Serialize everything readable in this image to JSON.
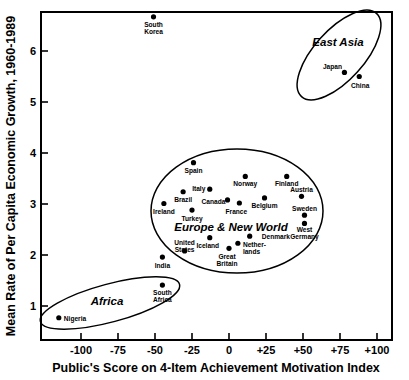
{
  "chart_data": {
    "type": "scatter",
    "title": "",
    "xlabel": "Public's Score on 4-Item Achievement Motivation Index",
    "ylabel": "Mean Rate of Per Capita Economic Growth, 1960-1989",
    "xlim": [
      -118,
      -118
    ],
    "ylim": [
      0.55,
      6.75
    ],
    "grid": false,
    "legend": "none",
    "xticks": [
      "-100",
      "-75",
      "-50",
      "-25",
      "0",
      "+25",
      "+50",
      "+75",
      "+100"
    ],
    "xtick_values": [
      -100,
      -75,
      -50,
      -25,
      0,
      25,
      50,
      75,
      100
    ],
    "yticks": [
      "1",
      "2",
      "3",
      "4",
      "5",
      "6"
    ],
    "ytick_values": [
      1,
      2,
      3,
      4,
      5,
      6
    ],
    "points": [
      {
        "label": "South Korea",
        "x": -51,
        "y": 6.67,
        "lx": 0,
        "ly": 10,
        "anchor": "middle"
      },
      {
        "label": "Japan",
        "x": 78,
        "y": 5.58,
        "lx": -12,
        "ly": -3,
        "anchor": "middle"
      },
      {
        "label": "China",
        "x": 88,
        "y": 5.5,
        "lx": 1,
        "ly": 11,
        "anchor": "middle"
      },
      {
        "label": "Spain",
        "x": -24,
        "y": 3.81,
        "lx": 0,
        "ly": 10,
        "anchor": "middle"
      },
      {
        "label": "Norway",
        "x": 11,
        "y": 3.54,
        "lx": 0,
        "ly": 10,
        "anchor": "middle"
      },
      {
        "label": "Finland",
        "x": 39,
        "y": 3.54,
        "lx": 0,
        "ly": 10,
        "anchor": "middle"
      },
      {
        "label": "Italy",
        "x": -13,
        "y": 3.29,
        "lx": -11,
        "ly": 2,
        "anchor": "middle"
      },
      {
        "label": "Brazil",
        "x": -31,
        "y": 3.24,
        "lx": 0,
        "ly": 10,
        "anchor": "middle"
      },
      {
        "label": "Austria",
        "x": 49,
        "y": 3.15,
        "lx": 0,
        "ly": -4,
        "anchor": "middle"
      },
      {
        "label": "Belgium",
        "x": 24,
        "y": 3.12,
        "lx": 0,
        "ly": 10,
        "anchor": "middle"
      },
      {
        "label": "Canada",
        "x": -1,
        "y": 3.08,
        "lx": -14,
        "ly": 4,
        "anchor": "middle"
      },
      {
        "label": "France",
        "x": 7,
        "y": 3.02,
        "lx": -3,
        "ly": 11,
        "anchor": "middle"
      },
      {
        "label": "Ireland",
        "x": -44,
        "y": 3.01,
        "lx": 0,
        "ly": 11,
        "anchor": "middle"
      },
      {
        "label": "Turkey",
        "x": -25,
        "y": 2.88,
        "lx": 0,
        "ly": 11,
        "anchor": "middle"
      },
      {
        "label": "Sweden",
        "x": 51,
        "y": 2.78,
        "lx": 0,
        "ly": -4,
        "anchor": "middle"
      },
      {
        "label": "West Germany",
        "x": 51,
        "y": 2.62,
        "lx": 0,
        "ly": 9,
        "anchor": "middle"
      },
      {
        "label": "Iceland",
        "x": -13,
        "y": 2.34,
        "lx": -2,
        "ly": 10,
        "anchor": "middle"
      },
      {
        "label": "Denmark",
        "x": 14,
        "y": 2.37,
        "lx": 12,
        "ly": 3,
        "anchor": "start"
      },
      {
        "label": "Netherlands",
        "x": 6,
        "y": 2.23,
        "lx": 5,
        "ly": 4,
        "anchor": "start"
      },
      {
        "label": "United States",
        "x": -30,
        "y": 2.08,
        "lx": 0,
        "ly": -6,
        "anchor": "middle"
      },
      {
        "label": "Great Britain",
        "x": 0,
        "y": 2.13,
        "lx": -2,
        "ly": 11,
        "anchor": "middle"
      },
      {
        "label": "India",
        "x": -45,
        "y": 1.96,
        "lx": 0,
        "ly": 11,
        "anchor": "middle"
      },
      {
        "label": "South Africa",
        "x": -45,
        "y": 1.41,
        "lx": 0,
        "ly": 10,
        "anchor": "middle"
      },
      {
        "label": "Nigeria",
        "x": -115,
        "y": 0.77,
        "lx": 5,
        "ly": 3,
        "anchor": "start"
      }
    ],
    "clusters": [
      {
        "name": "East Asia",
        "cx": 339,
        "cy": 55,
        "rx": 56,
        "ry": 25,
        "rot": -48,
        "lx": 338,
        "ly": 46,
        "fs": 11.5
      },
      {
        "name": "Europe & New World",
        "cx": 237,
        "cy": 211,
        "rx": 86,
        "ry": 62,
        "rot": 0,
        "lx": 231,
        "ly": 231,
        "fs": 11.5
      },
      {
        "name": "Africa",
        "cx": 110,
        "cy": 303,
        "rx": 72,
        "ry": 19,
        "rot": -15,
        "lx": 107,
        "ly": 305,
        "fs": 11.5
      }
    ]
  }
}
